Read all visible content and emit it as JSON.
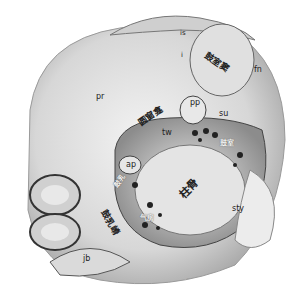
{
  "figure": {
    "type": "anatomical-illustration",
    "labels": [
      {
        "id": "pr",
        "text": "pr",
        "x": 96,
        "y": 93
      },
      {
        "id": "is",
        "text": "is",
        "x": 181,
        "y": 33
      },
      {
        "id": "i",
        "text": "i",
        "x": 181,
        "y": 53
      },
      {
        "id": "sinus",
        "text": "鼓室窦",
        "x": 205,
        "y": 55,
        "rotate": 35
      },
      {
        "id": "fn",
        "text": "fn",
        "x": 254,
        "y": 67
      },
      {
        "id": "rwn",
        "text": "圆窗龛",
        "x": 140,
        "y": 110,
        "rotate": -35
      },
      {
        "id": "pp",
        "text": "pp",
        "x": 190,
        "y": 100
      },
      {
        "id": "su",
        "text": "su",
        "x": 219,
        "y": 110
      },
      {
        "id": "tw",
        "text": "tw",
        "x": 162,
        "y": 130
      },
      {
        "id": "ap",
        "text": "ap",
        "x": 128,
        "y": 163
      },
      {
        "id": "white1",
        "text": "鼓室",
        "x": 222,
        "y": 142,
        "white": true
      },
      {
        "id": "white2",
        "text": "鼓乳",
        "x": 115,
        "y": 178,
        "white": true,
        "rotate": -50
      },
      {
        "id": "vertical",
        "text": "鼓乳嵴",
        "x": 103,
        "y": 207,
        "rotate": 60
      },
      {
        "id": "bone",
        "text": "柱骨",
        "x": 180,
        "y": 184,
        "rotate": -45
      },
      {
        "id": "white3",
        "text": "气房",
        "x": 140,
        "y": 215,
        "white": true
      },
      {
        "id": "sty",
        "text": "sty",
        "x": 232,
        "y": 205
      },
      {
        "id": "jb",
        "text": "jb",
        "x": 83,
        "y": 255
      }
    ],
    "signature": "artist signature"
  }
}
